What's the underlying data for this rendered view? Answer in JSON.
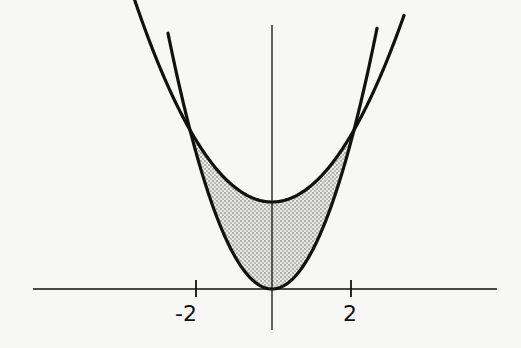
{
  "chart_data": {
    "type": "line",
    "title": "",
    "xlabel": "",
    "ylabel": "",
    "x_tick_labels": [
      "-2",
      "2"
    ],
    "x_ticks": [
      -2,
      2
    ],
    "grid": false,
    "legend": null,
    "series": [
      {
        "name": "steep parabola",
        "equation": "y = x^2",
        "vertex": [
          0,
          0
        ],
        "x_range": [
          -2.7,
          2.7
        ]
      },
      {
        "name": "broad parabola",
        "equation": "y = x^2/2 + 2",
        "vertex": [
          0,
          2
        ],
        "x_range": [
          -3.6,
          3.4
        ]
      }
    ],
    "intersections": [
      [
        -2,
        4
      ],
      [
        2,
        4
      ]
    ],
    "shaded_region": {
      "description": "region between the two parabolas for -2 <= x <= 2",
      "fill": "stippled gray dots"
    },
    "colors": {
      "curve": "#111111",
      "axis": "#111111",
      "shade_dot": "#555555",
      "background": "#f7f7f5"
    }
  },
  "labels": {
    "tick_neg2": "-2",
    "tick_pos2": "2"
  }
}
